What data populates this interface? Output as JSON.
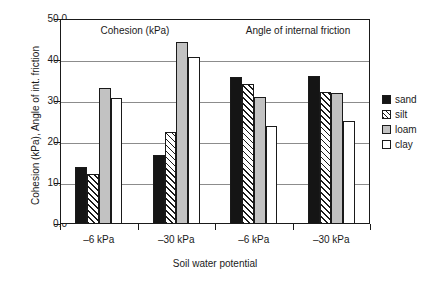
{
  "chart_data": {
    "type": "bar",
    "title": "",
    "xlabel": "Soil water potential",
    "ylabel": "Cohesion (kPa), Angle of int. friction",
    "ylim": [
      0.0,
      50.0
    ],
    "ytick_labels": [
      "50.0",
      "40.0",
      "30.0",
      "20.0",
      "10.0",
      "0.0"
    ],
    "ytick_values": [
      50.0,
      40.0,
      30.0,
      20.0,
      10.0,
      0.0
    ],
    "grid": true,
    "legend_position": "right",
    "categories": [
      "–6 kPa",
      "–30 kPa",
      "–6 kPa",
      "–30 kPa"
    ],
    "panels": [
      {
        "label": "Cohesion (kPa)",
        "categories": [
          "–6 kPa",
          "–30 kPa"
        ]
      },
      {
        "label": "Angle of internal friction",
        "categories": [
          "–6 kPa",
          "–30 kPa"
        ]
      }
    ],
    "series": [
      {
        "name": "sand",
        "values": [
          13.9,
          16.8,
          35.9,
          36.1
        ],
        "color": "#151515"
      },
      {
        "name": "silt",
        "values": [
          12.2,
          22.4,
          34.1,
          32.2
        ],
        "color": "#ffffff"
      },
      {
        "name": "loam",
        "values": [
          33.2,
          44.4,
          30.9,
          32.0
        ],
        "color": "#c2c2c2"
      },
      {
        "name": "clay",
        "values": [
          30.7,
          40.7,
          24.0,
          25.1
        ],
        "color": "#ffffff"
      }
    ]
  },
  "legend": {
    "items": [
      {
        "label": "sand",
        "swatch": "sand"
      },
      {
        "label": "silt",
        "swatch": "silt"
      },
      {
        "label": "loam",
        "swatch": "loam"
      },
      {
        "label": "clay",
        "swatch": "clay"
      }
    ]
  },
  "colors": {
    "axis": "#1a1a1a",
    "grid": "#8c8c8c",
    "background": "#ffffff"
  }
}
